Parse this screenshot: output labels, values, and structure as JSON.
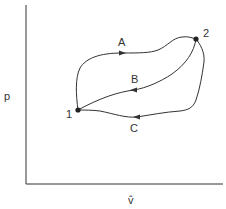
{
  "diagram": {
    "type": "p-v thermodynamic cycle diagram",
    "axes": {
      "y_label": "p",
      "x_label": "v̂"
    },
    "states": [
      {
        "id": "1",
        "label": "1",
        "x": 78,
        "y": 110
      },
      {
        "id": "2",
        "label": "2",
        "x": 196,
        "y": 39
      }
    ],
    "paths": [
      {
        "id": "A",
        "label": "A",
        "from": "1",
        "to": "2",
        "direction": "1 → 2 (upper path)"
      },
      {
        "id": "B",
        "label": "B",
        "from": "2",
        "to": "1",
        "direction": "2 → 1 (middle path)"
      },
      {
        "id": "C",
        "label": "C",
        "from": "2",
        "to": "1",
        "direction": "2 → 1 (lower path)"
      }
    ],
    "colors": {
      "line": "#333333",
      "background": "#ffffff"
    }
  }
}
